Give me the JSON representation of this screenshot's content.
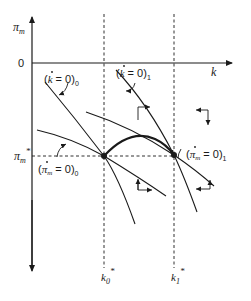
{
  "diagram": {
    "type": "phase-diagram",
    "axes": {
      "y_label": "π",
      "y_label_sub": "m",
      "x_label": "k",
      "origin_label": "0"
    },
    "levels": {
      "pi_star": "π",
      "pi_star_sub": "m",
      "pi_star_sup": "*",
      "k0_star": "k",
      "k0_sub": "0",
      "k0_sup": "*",
      "k1_star": "k",
      "k1_sub": "1",
      "k1_sup": "*"
    },
    "curve_labels": {
      "kdot0_open": "(",
      "kdot0_var": "k",
      "kdot0_eq": " = 0)",
      "kdot0_sub": "0",
      "kdot1_open": "(",
      "kdot1_var": "k",
      "kdot1_eq": " = 0)",
      "kdot1_sub": "1",
      "pidot0_open": "(",
      "pidot0_var": "π",
      "pidot0_varsub": "m",
      "pidot0_eq": " = 0)",
      "pidot0_sub": "0",
      "pidot1_open": "(",
      "pidot1_var": "π",
      "pidot1_varsub": "m",
      "pidot1_eq": " = 0)",
      "pidot1_sub": "1"
    },
    "equilibria": [
      {
        "name": "E0",
        "k": "k0*",
        "pi": "πm*"
      },
      {
        "name": "E1",
        "k": "k1*",
        "pi": "πm*"
      }
    ],
    "caption": ""
  }
}
